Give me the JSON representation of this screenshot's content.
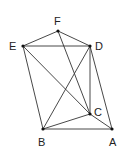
{
  "diagram": {
    "type": "geometric-figure",
    "background": "#ffffff",
    "stroke_color": "#333333",
    "point_color": "#111111",
    "points": [
      {
        "id": "A",
        "label": "A",
        "x": 112,
        "y": 129,
        "label_x": 109,
        "label_y": 146
      },
      {
        "id": "B",
        "label": "B",
        "x": 43,
        "y": 129,
        "label_x": 38,
        "label_y": 146
      },
      {
        "id": "C",
        "label": "C",
        "x": 90,
        "y": 114,
        "label_x": 94,
        "label_y": 116
      },
      {
        "id": "D",
        "label": "D",
        "x": 90,
        "y": 46,
        "label_x": 95,
        "label_y": 50
      },
      {
        "id": "E",
        "label": "E",
        "x": 23,
        "y": 46,
        "label_x": 9,
        "label_y": 50
      },
      {
        "id": "F",
        "label": "F",
        "x": 58,
        "y": 31,
        "label_x": 54,
        "label_y": 25
      }
    ],
    "segments": [
      [
        "E",
        "F"
      ],
      [
        "F",
        "D"
      ],
      [
        "E",
        "D"
      ],
      [
        "E",
        "B"
      ],
      [
        "E",
        "C"
      ],
      [
        "F",
        "C"
      ],
      [
        "D",
        "C"
      ],
      [
        "D",
        "B"
      ],
      [
        "D",
        "A"
      ],
      [
        "B",
        "C"
      ],
      [
        "B",
        "A"
      ],
      [
        "C",
        "A"
      ]
    ]
  }
}
